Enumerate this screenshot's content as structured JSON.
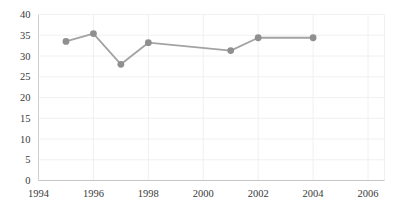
{
  "figure": {
    "background": "#ffffff"
  },
  "chart_data": {
    "type": "line",
    "x": [
      1995,
      1996,
      1997,
      1998,
      2001,
      2002,
      2004
    ],
    "values": [
      33.5,
      35.4,
      28.0,
      33.2,
      31.3,
      34.4,
      34.4
    ],
    "x_ticks": [
      1994,
      1996,
      1998,
      2000,
      2002,
      2004,
      2006
    ],
    "y_ticks": [
      0,
      5,
      10,
      15,
      20,
      25,
      30,
      35,
      40
    ],
    "xlim": [
      1994,
      2006.6
    ],
    "ylim": [
      0,
      40
    ],
    "grid": true,
    "legend": false,
    "title": "",
    "colors": {
      "line": "#a3a3a3",
      "marker": "#8f8f8f",
      "gridline": "#f2eff0",
      "y_axis": "#d2cfcf",
      "x_axis": "#c8c5c5",
      "tick_label": "#3a3a3a",
      "background": "#ffffff"
    }
  }
}
